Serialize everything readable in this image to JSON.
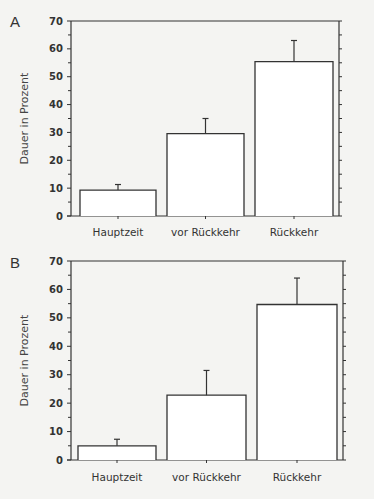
{
  "chart_data": [
    {
      "type": "bar",
      "panel": "A",
      "categories": [
        "Hauptzeit",
        "vor Rückkehr",
        "Rückkehr"
      ],
      "values": [
        9.3,
        29.6,
        55.4
      ],
      "error_upper": [
        11.3,
        35.0,
        63.0
      ],
      "ylabel": "Dauer in Prozent",
      "xlabel": "",
      "ylim": [
        0,
        70
      ],
      "yticks": [
        0,
        10,
        20,
        30,
        40,
        50,
        60,
        70
      ],
      "grid": false,
      "legend": null
    },
    {
      "type": "bar",
      "panel": "B",
      "categories": [
        "Hauptzeit",
        "vor Rückkehr",
        "Rückkehr"
      ],
      "values": [
        5.0,
        22.8,
        54.7
      ],
      "error_upper": [
        7.3,
        31.5,
        64.0
      ],
      "ylabel": "Dauer in Prozent",
      "xlabel": "",
      "ylim": [
        0,
        70
      ],
      "yticks": [
        0,
        10,
        20,
        30,
        40,
        50,
        60,
        70
      ],
      "grid": false,
      "legend": null
    }
  ],
  "panels": [
    {
      "letter": "A",
      "ylabel": "Dauer in Prozent",
      "categories": [
        "Hauptzeit",
        "vor Rückkehr",
        "Rückkehr"
      ],
      "ticks": [
        "0",
        "10",
        "20",
        "30",
        "40",
        "50",
        "60",
        "70"
      ]
    },
    {
      "letter": "B",
      "ylabel": "Dauer in Prozent",
      "categories": [
        "Hauptzeit",
        "vor Rückkehr",
        "Rückkehr"
      ],
      "ticks": [
        "0",
        "10",
        "20",
        "30",
        "40",
        "50",
        "60",
        "70"
      ]
    }
  ],
  "colors": {
    "axis": "#333333",
    "bar_fill": "#ffffff",
    "bar_stroke": "#333333",
    "background": "#f4f4f2"
  }
}
